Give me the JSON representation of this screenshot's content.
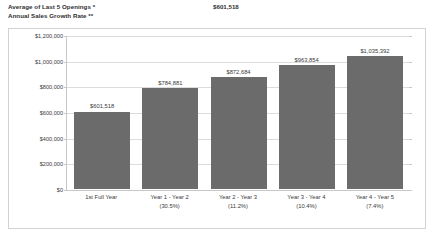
{
  "header": {
    "title_line1": "Average of Last 5 Openings *",
    "title_line2": "Annual Sales Growth Rate **",
    "value": "$601,518"
  },
  "chart_data": {
    "type": "bar",
    "title": "",
    "xlabel": "",
    "ylabel": "",
    "ylim": [
      0,
      1200000
    ],
    "ytick_step": 200000,
    "grid": true,
    "legend": "none",
    "bar_color": "#6b6b6b",
    "categories": [
      "1st Full Year",
      "Year 1 - Year 2",
      "Year 2 - Year 3",
      "Year 3 - Year 4",
      "Year 4 - Year 5"
    ],
    "category_sublabels": [
      "",
      "(30.5%)",
      "(11.2%)",
      "(10.4%)",
      "(7.4%)"
    ],
    "values": [
      601518,
      784881,
      872684,
      963854,
      1035392
    ],
    "value_labels": [
      "$601,518",
      "$784,881",
      "$872,684",
      "$963,854",
      "$1,035,392"
    ],
    "growth_rates": [
      null,
      30.5,
      11.2,
      10.4,
      7.4
    ],
    "ytick_labels": [
      "$1,200,000",
      "$1,000,000",
      "$800,000",
      "$600,000",
      "$400,000",
      "$200,000",
      "$0"
    ],
    "ytick_values": [
      1200000,
      1000000,
      800000,
      600000,
      400000,
      200000,
      0
    ]
  }
}
